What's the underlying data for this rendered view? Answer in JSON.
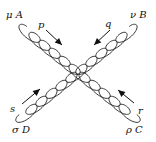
{
  "diagram": {
    "type": "feynman-four-gluon-vertex",
    "colors": {
      "line": "#222222",
      "arrow": "#111111",
      "background": "#ffffff"
    },
    "legs": [
      {
        "id": "A",
        "lorentz": "μ",
        "color_index": "A",
        "label": "μ A",
        "momentum": "p",
        "position": "top-left",
        "arrow": "incoming"
      },
      {
        "id": "B",
        "lorentz": "ν",
        "color_index": "B",
        "label": "ν B",
        "momentum": "q",
        "position": "top-right",
        "arrow": "incoming"
      },
      {
        "id": "C",
        "lorentz": "ρ",
        "color_index": "C",
        "label": "ρ C",
        "momentum": "r",
        "position": "bottom-right",
        "arrow": "incoming"
      },
      {
        "id": "D",
        "lorentz": "σ",
        "color_index": "D",
        "label": "σ D",
        "momentum": "s",
        "position": "bottom-left",
        "arrow": "incoming"
      }
    ]
  }
}
